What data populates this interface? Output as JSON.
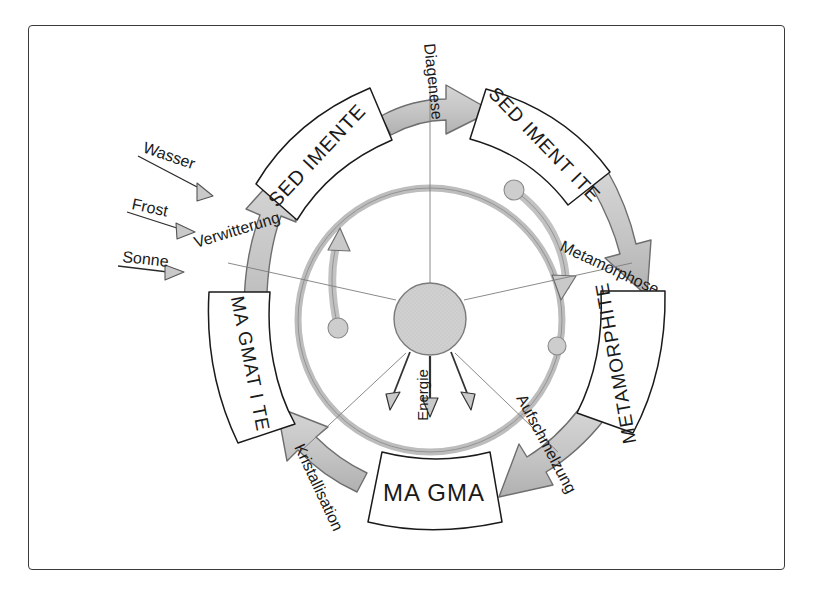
{
  "diagram": {
    "frame": {
      "border_color": "#3a3a3a"
    },
    "colors": {
      "arrow_fill": "#c9c9c9",
      "arrow_stroke": "#6e6e6e",
      "ring_fill": "#c4c4c4",
      "ring_stroke": "#8a8a8a",
      "box_stroke": "#1a1a1a",
      "box_fill": "#ffffff",
      "text": "#1a1a1a",
      "spoke": "#777777",
      "energy_arrow": "#333333",
      "core_fill": "#cccccc",
      "core_stroke": "#7a7a7a"
    },
    "boxes": [
      {
        "id": "sedimente",
        "label": "SED IMENTE",
        "position": "top-left"
      },
      {
        "id": "sedimentite",
        "label": "SED IMENT ITE",
        "position": "top-right"
      },
      {
        "id": "metamorphite",
        "label": "METAMORPHITE",
        "position": "right"
      },
      {
        "id": "magma",
        "label": "MA GMA",
        "position": "bottom"
      },
      {
        "id": "magmatite",
        "label": "MA GMAT I TE",
        "position": "left"
      }
    ],
    "process_arrows": [
      {
        "id": "verwitterung",
        "label": "Verwitterung",
        "from": "magmatite",
        "to": "sedimente"
      },
      {
        "id": "diagenese",
        "label": "Diagenese",
        "from": "sedimente",
        "to": "sedimentite"
      },
      {
        "id": "metamorphose",
        "label": "Metamorphose",
        "from": "sedimentite",
        "to": "metamorphite"
      },
      {
        "id": "aufschmelzung",
        "label": "Aufschmelzung",
        "from": "metamorphite",
        "to": "magma"
      },
      {
        "id": "kristallisation",
        "label": "Kristallisation",
        "from": "magma",
        "to": "magmatite"
      }
    ],
    "inputs": [
      {
        "id": "wasser",
        "label": "Wasser"
      },
      {
        "id": "frost",
        "label": "Frost"
      },
      {
        "id": "sonne",
        "label": "Sonne"
      }
    ],
    "center": {
      "energy_label": "Energie",
      "energy_arrow_count": 3,
      "spoke_count": 5,
      "inner_ring_arc_arrows": 2,
      "inner_ring_knobs": 3
    }
  }
}
